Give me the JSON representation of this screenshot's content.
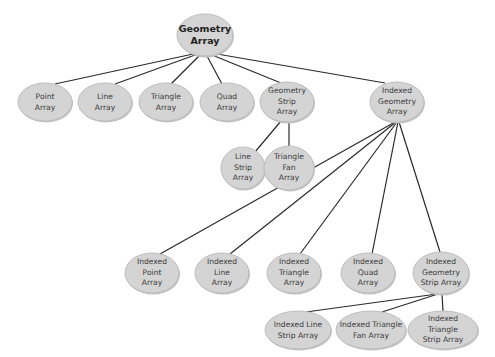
{
  "diagram": {
    "type": "class-hierarchy-tree",
    "colors": {
      "node_fill": "#d4d4d4",
      "node_border": "#bdbdbd",
      "edge": "#2a2a2a",
      "text": "#3a3a3a",
      "background": "#ffffff"
    },
    "nodes": [
      {
        "id": "geometry-array",
        "lines": [
          "Geometry",
          "Array"
        ],
        "cx": 205,
        "cy": 35,
        "rx": 28,
        "ry": 21,
        "root": true
      },
      {
        "id": "point-array",
        "lines": [
          "Point",
          "Array"
        ],
        "cx": 45,
        "cy": 102,
        "rx": 27,
        "ry": 19
      },
      {
        "id": "line-array",
        "lines": [
          "Line",
          "Array"
        ],
        "cx": 105,
        "cy": 102,
        "rx": 27,
        "ry": 19
      },
      {
        "id": "triangle-array",
        "lines": [
          "Triangle",
          "Array"
        ],
        "cx": 166,
        "cy": 102,
        "rx": 27,
        "ry": 19
      },
      {
        "id": "quad-array",
        "lines": [
          "Quad",
          "Array"
        ],
        "cx": 227,
        "cy": 102,
        "rx": 27,
        "ry": 19
      },
      {
        "id": "geometry-strip-array",
        "lines": [
          "Geometry",
          "Strip",
          "Array"
        ],
        "cx": 287,
        "cy": 102,
        "rx": 27,
        "ry": 20
      },
      {
        "id": "indexed-geometry-array",
        "lines": [
          "Indexed",
          "Geometry",
          "Array"
        ],
        "cx": 397,
        "cy": 102,
        "rx": 27,
        "ry": 20
      },
      {
        "id": "line-strip-array",
        "lines": [
          "Line",
          "Strip",
          "Array"
        ],
        "cx": 243,
        "cy": 168,
        "rx": 22,
        "ry": 21
      },
      {
        "id": "triangle-fan-array",
        "lines": [
          "Triangle",
          "Fan",
          "Array"
        ],
        "cx": 289,
        "cy": 168,
        "rx": 25,
        "ry": 22
      },
      {
        "id": "indexed-point-array",
        "lines": [
          "Indexed",
          "Point",
          "Array"
        ],
        "cx": 152,
        "cy": 273,
        "rx": 27,
        "ry": 20
      },
      {
        "id": "indexed-line-array",
        "lines": [
          "Indexed",
          "Line",
          "Array"
        ],
        "cx": 222,
        "cy": 273,
        "rx": 27,
        "ry": 20
      },
      {
        "id": "indexed-triangle-array",
        "lines": [
          "Indexed",
          "Triangle",
          "Array"
        ],
        "cx": 294,
        "cy": 273,
        "rx": 27,
        "ry": 20
      },
      {
        "id": "indexed-quad-array",
        "lines": [
          "Indexed",
          "Quad",
          "Array"
        ],
        "cx": 368,
        "cy": 273,
        "rx": 27,
        "ry": 20
      },
      {
        "id": "indexed-geometry-strip-array",
        "lines": [
          "Indexed",
          "Geometry",
          "Strip Array"
        ],
        "cx": 441,
        "cy": 273,
        "rx": 28,
        "ry": 21
      },
      {
        "id": "indexed-line-strip-array",
        "lines": [
          "Indexed Line",
          "Strip Array"
        ],
        "cx": 298,
        "cy": 330,
        "rx": 33,
        "ry": 19
      },
      {
        "id": "indexed-triangle-fan-array",
        "lines": [
          "Indexed Triangle",
          "Fan Array"
        ],
        "cx": 371,
        "cy": 330,
        "rx": 35,
        "ry": 19
      },
      {
        "id": "indexed-triangle-strip-array",
        "lines": [
          "Indexed Triangle",
          "Strip Array"
        ],
        "cx": 443,
        "cy": 330,
        "rx": 35,
        "ry": 19
      }
    ],
    "edges": [
      {
        "from": "geometry-array",
        "to": "point-array",
        "x1": 193,
        "y1": 54,
        "x2": 55,
        "y2": 84
      },
      {
        "from": "geometry-array",
        "to": "line-array",
        "x1": 195,
        "y1": 55,
        "x2": 115,
        "y2": 84
      },
      {
        "from": "geometry-array",
        "to": "triangle-array",
        "x1": 199,
        "y1": 56,
        "x2": 171,
        "y2": 84
      },
      {
        "from": "geometry-array",
        "to": "quad-array",
        "x1": 207,
        "y1": 56,
        "x2": 222,
        "y2": 84
      },
      {
        "from": "geometry-array",
        "to": "geometry-strip-array",
        "x1": 212,
        "y1": 55,
        "x2": 281,
        "y2": 83
      },
      {
        "from": "geometry-array",
        "to": "indexed-geometry-array",
        "x1": 217,
        "y1": 54,
        "x2": 385,
        "y2": 83
      },
      {
        "from": "geometry-strip-array",
        "to": "line-strip-array",
        "x1": 281,
        "y1": 121,
        "x2": 255,
        "y2": 152
      },
      {
        "from": "geometry-strip-array",
        "to": "triangle-fan-array",
        "x1": 289,
        "y1": 122,
        "x2": 289,
        "y2": 146
      },
      {
        "from": "indexed-geometry-array",
        "to": "indexed-point-array",
        "x1": 395,
        "y1": 122,
        "x2": 160,
        "y2": 254
      },
      {
        "from": "indexed-geometry-array",
        "to": "indexed-line-array",
        "x1": 396,
        "y1": 122,
        "x2": 230,
        "y2": 254
      },
      {
        "from": "indexed-geometry-array",
        "to": "indexed-triangle-array",
        "x1": 397,
        "y1": 122,
        "x2": 300,
        "y2": 254
      },
      {
        "from": "indexed-geometry-array",
        "to": "indexed-quad-array",
        "x1": 398,
        "y1": 122,
        "x2": 372,
        "y2": 254
      },
      {
        "from": "indexed-geometry-array",
        "to": "indexed-geometry-strip-array",
        "x1": 399,
        "y1": 122,
        "x2": 440,
        "y2": 252
      },
      {
        "from": "indexed-geometry-strip-array",
        "to": "indexed-line-strip-array",
        "x1": 437,
        "y1": 294,
        "x2": 306,
        "y2": 312
      },
      {
        "from": "indexed-geometry-strip-array",
        "to": "indexed-triangle-fan-array",
        "x1": 438,
        "y1": 294,
        "x2": 382,
        "y2": 312
      },
      {
        "from": "indexed-geometry-strip-array",
        "to": "indexed-triangle-strip-array",
        "x1": 442,
        "y1": 294,
        "x2": 443,
        "y2": 311
      }
    ]
  }
}
